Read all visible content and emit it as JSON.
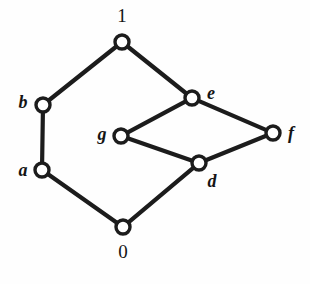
{
  "figure": {
    "kind": "hasse-diagram",
    "background_color": "#fefefe",
    "ink_color": "#1c1c1c",
    "width": 310,
    "height": 284
  },
  "chart_data": {
    "type": "diagram",
    "title": "",
    "xlabel": "",
    "ylabel": "",
    "grid": false,
    "legend": null,
    "nodes": [
      {
        "id": "1",
        "label": "1",
        "style": "numeral",
        "cx": 122,
        "cy": 42,
        "r": 7.0,
        "label_x": 122,
        "label_y": 15,
        "label_pos": "above"
      },
      {
        "id": "b",
        "label": "b",
        "style": "italic",
        "cx": 43,
        "cy": 105,
        "r": 7.0,
        "label_x": 23,
        "label_y": 102,
        "label_pos": "left"
      },
      {
        "id": "e",
        "label": "e",
        "style": "italic",
        "cx": 192,
        "cy": 98,
        "r": 7.0,
        "label_x": 211,
        "label_y": 93,
        "label_pos": "right"
      },
      {
        "id": "g",
        "label": "g",
        "style": "italic",
        "cx": 121,
        "cy": 136,
        "r": 7.0,
        "label_x": 102,
        "label_y": 134,
        "label_pos": "left"
      },
      {
        "id": "f",
        "label": "f",
        "style": "italic",
        "cx": 273,
        "cy": 133,
        "r": 7.0,
        "label_x": 291,
        "label_y": 133,
        "label_pos": "right"
      },
      {
        "id": "a",
        "label": "a",
        "style": "italic",
        "cx": 42,
        "cy": 170,
        "r": 7.0,
        "label_x": 23,
        "label_y": 170,
        "label_pos": "left"
      },
      {
        "id": "d",
        "label": "d",
        "style": "italic",
        "cx": 199,
        "cy": 163,
        "r": 7.0,
        "label_x": 212,
        "label_y": 181,
        "label_pos": "below-right"
      },
      {
        "id": "0",
        "label": "0",
        "style": "numeral",
        "cx": 123,
        "cy": 227,
        "r": 7.0,
        "label_x": 123,
        "label_y": 251,
        "label_pos": "below"
      }
    ],
    "edges": [
      {
        "from": "b",
        "to": "1"
      },
      {
        "from": "e",
        "to": "1"
      },
      {
        "from": "a",
        "to": "b"
      },
      {
        "from": "g",
        "to": "e"
      },
      {
        "from": "e",
        "to": "f"
      },
      {
        "from": "g",
        "to": "d"
      },
      {
        "from": "d",
        "to": "f"
      },
      {
        "from": "0",
        "to": "a"
      },
      {
        "from": "0",
        "to": "d"
      }
    ]
  }
}
